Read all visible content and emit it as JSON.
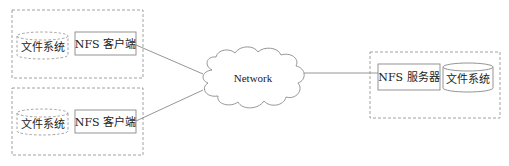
{
  "diagram": {
    "type": "NFS architecture",
    "clients": [
      {
        "filesystem_label": "文件系统",
        "client_label": "NFS 客户端"
      },
      {
        "filesystem_label": "文件系统",
        "client_label": "NFS 客户端"
      }
    ],
    "network": {
      "label": "Network"
    },
    "server": {
      "server_label": "NFS 服务器",
      "filesystem_label": "文件系统"
    },
    "colors": {
      "line": "#8a8a8a",
      "dashed": "#8a8a8a",
      "text": "#222222",
      "background": "#ffffff"
    }
  }
}
